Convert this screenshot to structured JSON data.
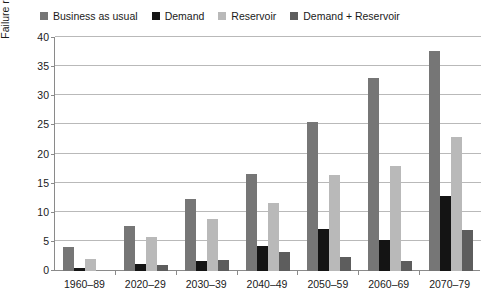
{
  "chart_data": {
    "type": "bar",
    "title": "",
    "xlabel": "",
    "ylabel": "Failure rate (% climate model runs)",
    "ylim": [
      0,
      40
    ],
    "ytick_step": 5,
    "yticks": [
      40,
      35,
      30,
      25,
      20,
      15,
      10,
      5,
      0
    ],
    "grid": true,
    "legend_position": "top",
    "categories": [
      "1960–89",
      "2020–29",
      "2030–39",
      "2040–49",
      "2050–59",
      "2060–69",
      "2070–79"
    ],
    "series": [
      {
        "name": "Business as usual",
        "color": "#767676",
        "values": [
          4.2,
          7.7,
          12.4,
          16.6,
          25.6,
          33.2,
          37.8
        ]
      },
      {
        "name": "Demand",
        "color": "#141414",
        "values": [
          0.6,
          1.2,
          1.8,
          4.3,
          7.2,
          5.3,
          12.8
        ]
      },
      {
        "name": "Reservoir",
        "color": "#b9b9b9",
        "values": [
          2.0,
          5.8,
          8.9,
          11.7,
          16.5,
          18.0,
          23.0
        ]
      },
      {
        "name": "Demand + Reservoir",
        "color": "#5d5d5d",
        "values": [
          0.0,
          1.0,
          1.9,
          3.2,
          2.4,
          1.7,
          7.0
        ]
      }
    ]
  },
  "legend": {
    "items": [
      {
        "label": "Business as usual",
        "color": "#767676"
      },
      {
        "label": "Demand",
        "color": "#141414"
      },
      {
        "label": "Reservoir",
        "color": "#b9b9b9"
      },
      {
        "label": "Demand + Reservoir",
        "color": "#5d5d5d"
      }
    ]
  },
  "axes": {
    "y_title": "Failure rate (% climate model runs)",
    "y_ticks": [
      "40",
      "35",
      "30",
      "25",
      "20",
      "15",
      "10",
      "5",
      "0"
    ],
    "x_ticks": [
      "1960–89",
      "2020–29",
      "2030–39",
      "2040–49",
      "2050–59",
      "2060–69",
      "2070–79"
    ]
  }
}
